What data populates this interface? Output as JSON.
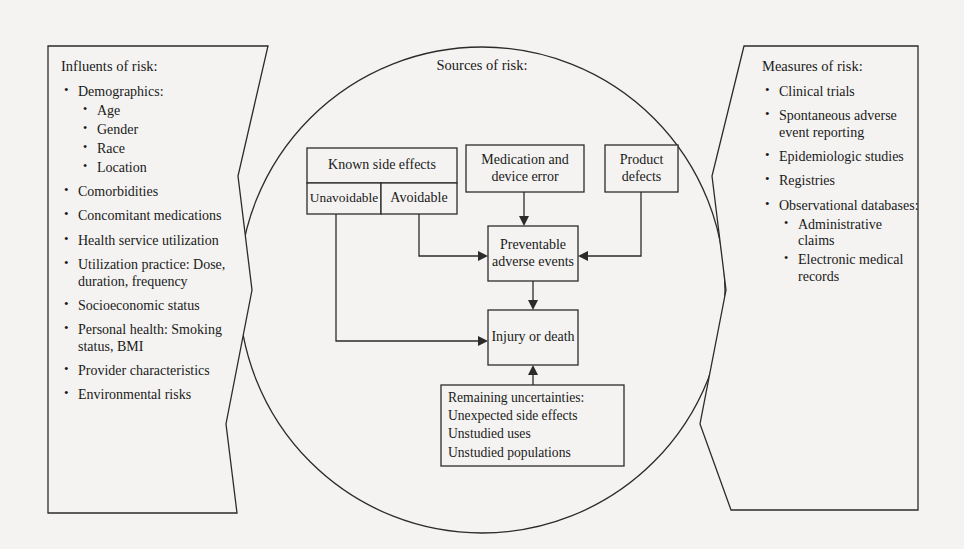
{
  "figure": {
    "background_color": "#f4f3f1",
    "line_color": "#2b2b2b",
    "text_color": "#1a1a1a"
  },
  "left_panel": {
    "title": "Influents of risk:",
    "items": [
      {
        "label": "Demographics:",
        "sub": [
          "Age",
          "Gender",
          "Race",
          "Location"
        ]
      },
      {
        "label": "Comorbidities",
        "sub": []
      },
      {
        "label": "Concomitant medications",
        "sub": []
      },
      {
        "label": "Health service utilization",
        "sub": []
      },
      {
        "label": "Utilization practice: Dose, duration, frequency",
        "sub": []
      },
      {
        "label": "Socioeconomic status",
        "sub": []
      },
      {
        "label": "Personal health: Smoking status, BMI",
        "sub": []
      },
      {
        "label": "Provider characteristics",
        "sub": []
      },
      {
        "label": "Environmental risks",
        "sub": []
      }
    ]
  },
  "right_panel": {
    "title": "Measures of risk:",
    "items": [
      {
        "label": "Clinical trials",
        "sub": []
      },
      {
        "label": "Spontaneous adverse event reporting",
        "sub": []
      },
      {
        "label": "Epidemiologic studies",
        "sub": []
      },
      {
        "label": "Registries",
        "sub": []
      },
      {
        "label": "Observational databases:",
        "sub": [
          "Administrative claims",
          "Electronic medical records"
        ]
      }
    ]
  },
  "center": {
    "title": "Sources of risk:",
    "boxes": {
      "known_side_effects": "Known side effects",
      "unavoidable": "Unavoidable",
      "avoidable": "Avoidable",
      "medication_device_error": "Medication and device error",
      "product_defects": "Product defects",
      "preventable_adverse_events": "Preventable adverse events",
      "injury_or_death": "Injury or death",
      "remaining_uncertainties": "Remaining uncertainties:\nUnexpected side effects\nUnstudied uses\nUnstudied populations"
    }
  }
}
